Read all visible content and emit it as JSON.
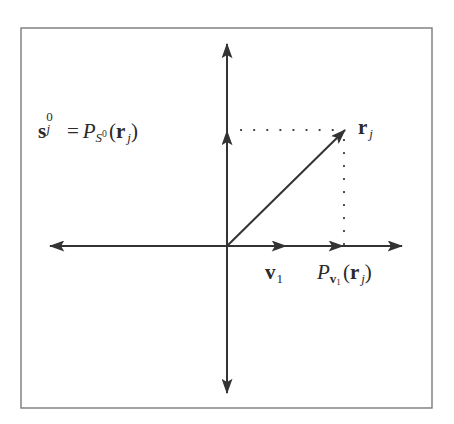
{
  "figure": {
    "border_color": "#7a7a7a",
    "line_color": "#333333",
    "background": "#ffffff",
    "frame": {
      "x": 21,
      "y": 28,
      "width": 411,
      "height": 380
    },
    "origin": {
      "x": 227,
      "y": 246
    },
    "axes": {
      "horizontal": {
        "x_start": 50,
        "x_end": 402,
        "y": 246
      },
      "vertical": {
        "y_start": 44,
        "y_end": 393,
        "x": 227
      }
    },
    "vectors": [
      {
        "name": "r_j",
        "from": [
          227,
          246
        ],
        "to": [
          345,
          130
        ]
      },
      {
        "name": "v_1",
        "from": [
          227,
          246
        ],
        "to": [
          285,
          246
        ]
      },
      {
        "name": "P_v1_r_j",
        "from": [
          227,
          246
        ],
        "to": [
          342,
          246
        ]
      },
      {
        "name": "s_j0",
        "from": [
          227,
          246
        ],
        "to": [
          227,
          130
        ]
      }
    ],
    "dotted_lines": [
      {
        "name": "projection-to-vertical",
        "from": [
          240,
          130
        ],
        "to": [
          343,
          130
        ]
      },
      {
        "name": "projection-to-horizontal",
        "from": [
          344,
          138
        ],
        "to": [
          344,
          244
        ]
      }
    ]
  },
  "labels": {
    "s_j0_eq": {
      "s": "s",
      "s_sup": "0",
      "s_sub": "j",
      "equals": "=",
      "P": "P",
      "P_sub_S": "S",
      "P_sub_S_sup": "0",
      "open": "(",
      "r": "r",
      "r_sub": "j",
      "close": ")"
    },
    "r_j": {
      "r": "r",
      "sub": "j"
    },
    "v_1": {
      "v": "v",
      "sub": "1"
    },
    "P_v1": {
      "P": "P",
      "sub_v": "v",
      "sub_v_sub": "1",
      "open": "(",
      "r": "r",
      "r_sub": "j",
      "close": ")"
    }
  }
}
